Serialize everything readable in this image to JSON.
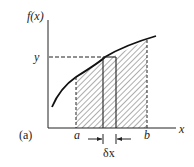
{
  "figure": {
    "panel_label": "(a)",
    "y_axis_label": "f(x)",
    "x_axis_label": "x",
    "y_marker_label": "y",
    "lower_bound_label": "a",
    "upper_bound_label": "b",
    "strip_width_label": "δx"
  },
  "colors": {
    "ink": "#222222",
    "background": "#ffffff"
  }
}
